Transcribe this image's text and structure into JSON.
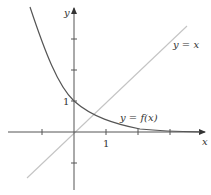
{
  "diagram": {
    "type": "function-graph",
    "axes": {
      "x_label": "x",
      "y_label": "y",
      "x_tick_label": "1",
      "y_tick_label": "1",
      "x_ticks": [
        -1,
        1,
        2,
        3
      ],
      "y_ticks": [
        -1,
        1,
        2,
        3
      ],
      "axis_color": "#555555"
    },
    "curves": [
      {
        "label": "y = f(x)",
        "formula": "e^(-x)",
        "color": "#555555"
      },
      {
        "label": "y = x",
        "formula": "x",
        "color": "#bbbbbb"
      }
    ]
  }
}
